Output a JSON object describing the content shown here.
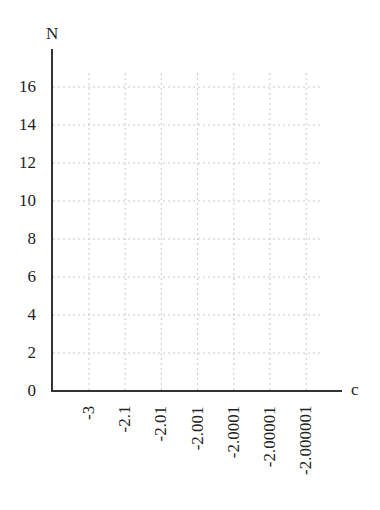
{
  "chart_data": {
    "type": "line",
    "title": "",
    "xlabel": "c",
    "ylabel": "N",
    "categories": [
      "-3",
      "-2.1",
      "-2.01",
      "-2.001",
      "-2.0001",
      "-2.00001",
      "-2.000001"
    ],
    "series": [],
    "yticks": [
      "0",
      "2",
      "4",
      "6",
      "8",
      "10",
      "12",
      "14",
      "16"
    ],
    "ylim": [
      0,
      17
    ],
    "grid": true,
    "legend": "none"
  }
}
